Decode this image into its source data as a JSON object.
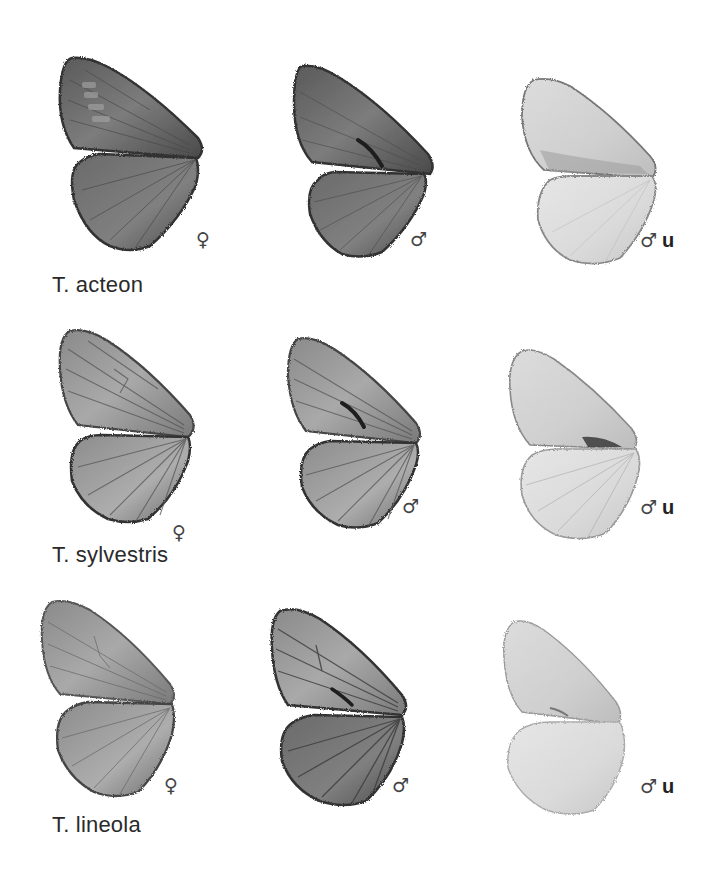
{
  "plate": {
    "rows": [
      {
        "species": "T. acteon",
        "specimens": [
          {
            "sex_symbol": "♀",
            "side": "",
            "tone": "dark"
          },
          {
            "sex_symbol": "♂",
            "side": "",
            "tone": "dark"
          },
          {
            "sex_symbol": "♂",
            "side": "u",
            "tone": "light"
          }
        ]
      },
      {
        "species": "T. sylvestris",
        "specimens": [
          {
            "sex_symbol": "♀",
            "side": "",
            "tone": "medium"
          },
          {
            "sex_symbol": "♂",
            "side": "",
            "tone": "medium"
          },
          {
            "sex_symbol": "♂",
            "side": "u",
            "tone": "light"
          }
        ]
      },
      {
        "species": "T. lineola",
        "specimens": [
          {
            "sex_symbol": "♀",
            "side": "",
            "tone": "medium"
          },
          {
            "sex_symbol": "♂",
            "side": "",
            "tone": "medium"
          },
          {
            "sex_symbol": "♂",
            "side": "u",
            "tone": "light"
          }
        ]
      }
    ]
  },
  "colors": {
    "background": "#ffffff",
    "dark_wing": "#6e6e6e",
    "medium_wing": "#9a9a9a",
    "light_wing": "#d9d9d9",
    "outline": "#3a3a3a",
    "text": "#2a2a2a"
  }
}
